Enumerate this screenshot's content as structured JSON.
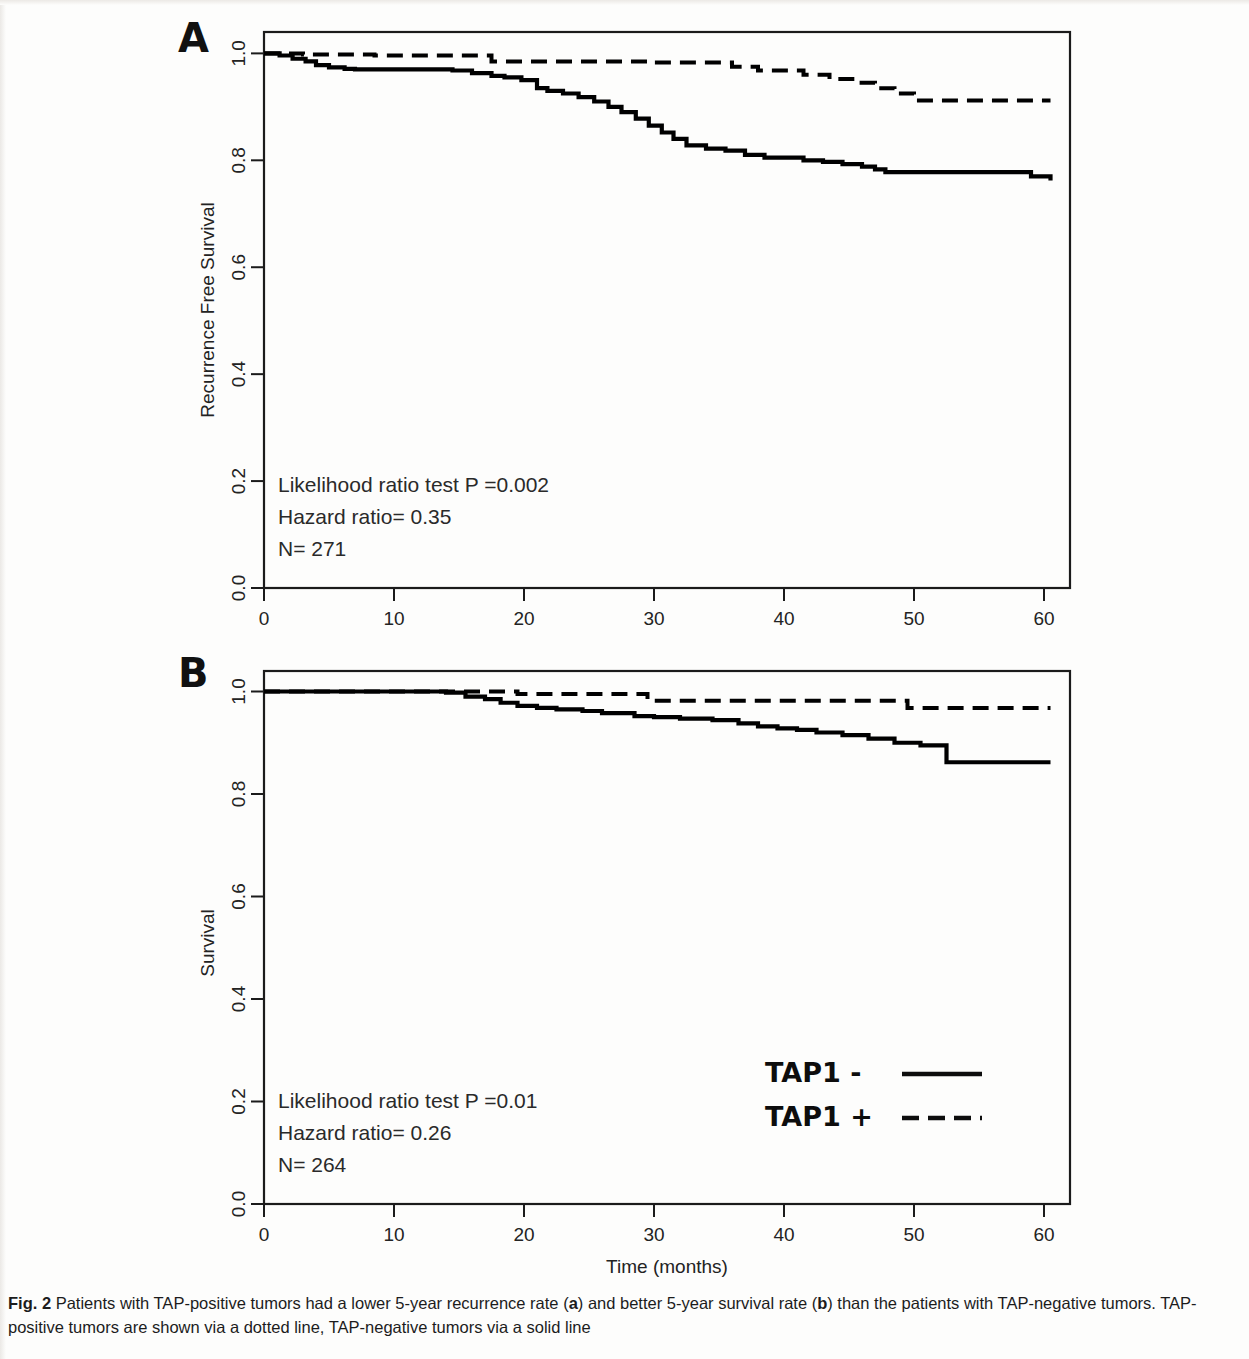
{
  "figure": {
    "label": "Fig. 2",
    "caption_text": "Patients with TAP-positive tumors had a lower 5-year recurrence rate (a) and better 5-year survival rate (b) than the patients with TAP-negative tumors. TAP-positive tumors are shown via a dotted line, TAP-negative tumors via a solid line",
    "caption_full": "Fig. 2 Patients with TAP-positive tumors had a lower 5-year recurrence rate (a) and better 5-year survival rate (b) than the patients with TAP-negative tumors. TAP-positive tumors are shown via a dotted line, TAP-negative tumors via a solid line",
    "caption_marker_a": "a",
    "caption_marker_b": "b"
  },
  "panel_a": {
    "letter": "A",
    "annotations": {
      "likelihood": "Likelihood ratio test P =0.002",
      "hazard": "Hazard ratio= 0.35",
      "n": "N= 271"
    }
  },
  "panel_b": {
    "letter": "B",
    "annotations": {
      "likelihood": "Likelihood ratio test P =0.01",
      "hazard": "Hazard ratio= 0.26",
      "n": "N= 264"
    }
  },
  "legend": {
    "entries": [
      {
        "label": "TAP1 -",
        "style": "solid"
      },
      {
        "label": "TAP1 +",
        "style": "dashed"
      }
    ]
  },
  "shared_axis": {
    "xlabel": "Time (months)",
    "xticks": [
      "0",
      "10",
      "20",
      "30",
      "40",
      "50",
      "60"
    ],
    "yticks": [
      "0.0",
      "0.2",
      "0.4",
      "0.6",
      "0.8",
      "1.0"
    ]
  },
  "chart_data": [
    {
      "type": "line",
      "panel": "A",
      "title": "",
      "xlabel": "Time (months)",
      "ylabel": "Recurrence Free Survival",
      "xlim": [
        0,
        62
      ],
      "ylim": [
        0.0,
        1.04
      ],
      "xticks": [
        0,
        10,
        20,
        30,
        40,
        50,
        60
      ],
      "yticks": [
        0.0,
        0.2,
        0.4,
        0.6,
        0.8,
        1.0
      ],
      "grid": false,
      "legend_position": "external-bottom-right",
      "annotations": [
        "Likelihood ratio test P =0.002",
        "Hazard ratio= 0.35",
        "N= 271"
      ],
      "series": [
        {
          "name": "TAP1 -",
          "style": "solid",
          "color": "#000000",
          "step": "post",
          "x": [
            0,
            1.2,
            2.2,
            3.2,
            4.0,
            5.0,
            6.2,
            7.0,
            14.5,
            16.0,
            17.5,
            18.5,
            19.8,
            21.0,
            21.8,
            23.0,
            24.2,
            25.4,
            26.5,
            27.5,
            28.6,
            29.6,
            30.6,
            31.5,
            32.5,
            34.0,
            35.5,
            37.0,
            38.5,
            41.5,
            43.0,
            44.5,
            46.0,
            47.0,
            47.8,
            59.0,
            60.5
          ],
          "y": [
            1.0,
            0.996,
            0.99,
            0.985,
            0.978,
            0.974,
            0.971,
            0.97,
            0.968,
            0.963,
            0.958,
            0.955,
            0.95,
            0.935,
            0.93,
            0.925,
            0.918,
            0.91,
            0.9,
            0.89,
            0.878,
            0.865,
            0.852,
            0.84,
            0.828,
            0.822,
            0.818,
            0.81,
            0.805,
            0.8,
            0.797,
            0.793,
            0.788,
            0.783,
            0.778,
            0.77,
            0.762
          ]
        },
        {
          "name": "TAP1 +",
          "style": "dashed",
          "color": "#000000",
          "step": "post",
          "x": [
            0,
            3.0,
            8.5,
            17.5,
            29.5,
            36.0,
            38.0,
            41.5,
            43.5,
            45.5,
            47.0,
            48.5,
            50.0,
            60.5
          ],
          "y": [
            1.0,
            0.998,
            0.996,
            0.985,
            0.983,
            0.975,
            0.968,
            0.96,
            0.952,
            0.945,
            0.935,
            0.925,
            0.912,
            0.912
          ]
        }
      ]
    },
    {
      "type": "line",
      "panel": "B",
      "title": "",
      "xlabel": "Time (months)",
      "ylabel": "Survival",
      "xlim": [
        0,
        62
      ],
      "ylim": [
        0.0,
        1.04
      ],
      "xticks": [
        0,
        10,
        20,
        30,
        40,
        50,
        60
      ],
      "yticks": [
        0.0,
        0.2,
        0.4,
        0.6,
        0.8,
        1.0
      ],
      "grid": false,
      "legend_position": "inside-bottom-right",
      "annotations": [
        "Likelihood ratio test P =0.01",
        "Hazard ratio= 0.26",
        "N= 264"
      ],
      "series": [
        {
          "name": "TAP1 -",
          "style": "solid",
          "color": "#000000",
          "step": "post",
          "x": [
            0,
            14.0,
            15.5,
            17.0,
            18.2,
            19.5,
            21.0,
            22.5,
            24.5,
            26.0,
            28.5,
            30.0,
            32.0,
            34.5,
            36.5,
            38.0,
            39.5,
            41.0,
            42.5,
            44.5,
            46.5,
            48.5,
            50.5,
            52.5,
            60.5
          ],
          "y": [
            1.0,
            0.998,
            0.99,
            0.985,
            0.978,
            0.972,
            0.968,
            0.965,
            0.962,
            0.958,
            0.952,
            0.95,
            0.947,
            0.944,
            0.938,
            0.932,
            0.928,
            0.925,
            0.92,
            0.915,
            0.908,
            0.9,
            0.895,
            0.862,
            0.862
          ]
        },
        {
          "name": "TAP1 +",
          "style": "dashed",
          "color": "#000000",
          "step": "post",
          "x": [
            0,
            14.5,
            19.5,
            29.5,
            49.5,
            60.5
          ],
          "y": [
            1.0,
            1.0,
            0.995,
            0.982,
            0.968,
            0.968
          ]
        }
      ]
    }
  ]
}
